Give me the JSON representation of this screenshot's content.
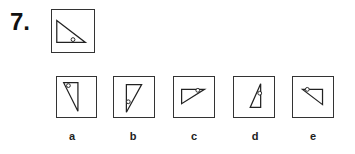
{
  "question": {
    "number": "7.",
    "stem_figure": {
      "shape": "right-triangle-with-circle",
      "triangle": [
        [
          5,
          11
        ],
        [
          5,
          34
        ],
        [
          35,
          34
        ]
      ],
      "circle": [
        22,
        31
      ]
    }
  },
  "options": [
    {
      "label": "a",
      "triangle": [
        [
          7,
          6
        ],
        [
          22,
          6
        ],
        [
          22,
          36
        ]
      ],
      "circle": [
        12,
        9
      ]
    },
    {
      "label": "b",
      "triangle": [
        [
          13,
          8
        ],
        [
          29,
          8
        ],
        [
          13,
          37
        ]
      ],
      "circle": [
        15,
        26
      ]
    },
    {
      "label": "c",
      "triangle": [
        [
          8,
          13
        ],
        [
          32,
          13
        ],
        [
          8,
          28
        ]
      ],
      "circle": [
        25,
        14
      ]
    },
    {
      "label": "d",
      "triangle": [
        [
          17,
          32
        ],
        [
          28,
          32
        ],
        [
          28,
          7
        ]
      ],
      "circle": [
        27,
        17
      ]
    },
    {
      "label": "e",
      "triangle": [
        [
          10,
          13
        ],
        [
          31,
          13
        ],
        [
          31,
          29
        ]
      ],
      "circle": [
        15,
        13
      ]
    }
  ]
}
